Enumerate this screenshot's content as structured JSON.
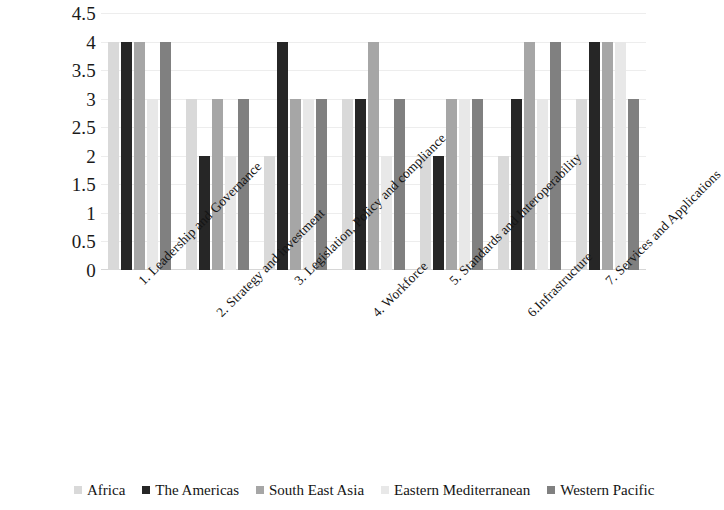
{
  "chart_data": {
    "type": "bar",
    "title": "",
    "subtitle": "",
    "xlabel": "",
    "ylabel": "",
    "ylim": [
      0,
      4.5
    ],
    "grid": true,
    "legend_position": "bottom",
    "y_ticks": [
      "4.5",
      "4",
      "3.5",
      "3",
      "2.5",
      "2",
      "1.5",
      "1",
      "0.5",
      "0"
    ],
    "y_tick_values": [
      4.5,
      4,
      3.5,
      3,
      2.5,
      2,
      1.5,
      1,
      0.5,
      0
    ],
    "categories": [
      "1. Leadership and Governance",
      "2. Strategy and investment",
      "3. Legislation, Policy and compliance",
      "4. Workforce",
      "5. Standards and Interoperability",
      "6.Infrastructure",
      "7. Services and Applications"
    ],
    "series": [
      {
        "name": "Africa",
        "color": "#d9d9d9",
        "values": [
          4,
          3,
          2,
          3,
          2,
          2,
          3
        ]
      },
      {
        "name": "The Americas",
        "color": "#262626",
        "values": [
          4,
          2,
          4,
          3,
          2,
          3,
          4
        ]
      },
      {
        "name": "South East Asia",
        "color": "#a6a6a6",
        "values": [
          4,
          3,
          3,
          4,
          3,
          4,
          4
        ]
      },
      {
        "name": "Eastern Mediterranean",
        "color": "#e8e8e8",
        "values": [
          3,
          2,
          3,
          2,
          3,
          3,
          4
        ]
      },
      {
        "name": "Western Pacific",
        "color": "#808080",
        "values": [
          4,
          3,
          3,
          3,
          3,
          4,
          3
        ]
      }
    ]
  }
}
